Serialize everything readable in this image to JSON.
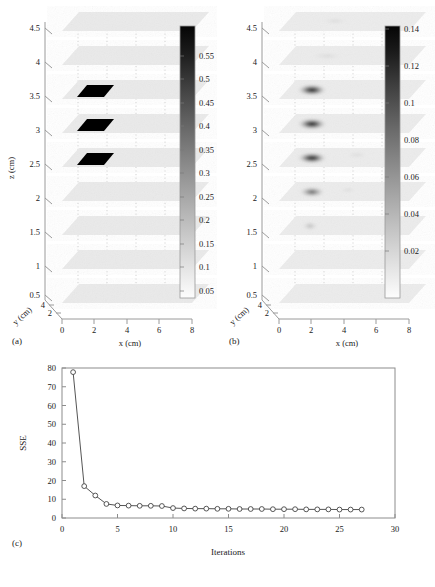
{
  "figure": {
    "background": "#ffffff",
    "axis_color": "#9a9a9a",
    "text_color": "#1a1a1a",
    "line_color": "#4d4d4d",
    "anomaly_color": "#000000"
  },
  "panels": [
    {
      "tag": "(a)",
      "type": "3d-slice-stack",
      "x_axis": {
        "label": "x (cm)",
        "ticks": [
          "0",
          "2",
          "4",
          "6",
          "8"
        ],
        "min": 0,
        "max": 8
      },
      "y_axis": {
        "label": "y (cm)",
        "ticks": [
          "2",
          "4"
        ],
        "min": 0,
        "max": 5
      },
      "z_axis": {
        "label": "z (cm)",
        "ticks": [
          "0.5",
          "1",
          "1.5",
          "2",
          "2.5",
          "3",
          "3.5",
          "4",
          "4.5"
        ],
        "min": 0.5,
        "max": 4.5
      },
      "colorbar": {
        "ticks": [
          "0.05",
          "0.1",
          "0.15",
          "0.2",
          "0.25",
          "0.3",
          "0.35",
          "0.4",
          "0.45",
          "0.5",
          "0.55"
        ],
        "min": 0.0,
        "max": 0.58,
        "colormap": "gray-inverted"
      },
      "slices": [
        {
          "z": 4.5,
          "anomaly": false,
          "peak": 0.0
        },
        {
          "z": 4.0,
          "anomaly": false,
          "peak": 0.0
        },
        {
          "z": 3.5,
          "anomaly": true,
          "peak": 0.58
        },
        {
          "z": 3.0,
          "anomaly": true,
          "peak": 0.58
        },
        {
          "z": 2.5,
          "anomaly": true,
          "peak": 0.58
        },
        {
          "z": 2.0,
          "anomaly": false,
          "peak": 0.0
        },
        {
          "z": 1.5,
          "anomaly": false,
          "peak": 0.0
        },
        {
          "z": 1.0,
          "anomaly": false,
          "peak": 0.0
        },
        {
          "z": 0.5,
          "anomaly": false,
          "peak": 0.0
        }
      ],
      "anomaly_extent": {
        "x_min": 1.6,
        "x_max": 3.2,
        "y_min": 2.0,
        "y_max": 3.4
      }
    },
    {
      "tag": "(b)",
      "type": "3d-slice-stack",
      "x_axis": {
        "label": "x (cm)",
        "ticks": [
          "0",
          "2",
          "4",
          "6",
          "8"
        ],
        "min": 0,
        "max": 8
      },
      "y_axis": {
        "label": "y (cm)",
        "ticks": [
          "2",
          "4"
        ],
        "min": 0,
        "max": 5
      },
      "z_axis": {
        "label": "z (cm)",
        "ticks": [
          "0.5",
          "1",
          "1.5",
          "2",
          "2.5",
          "3",
          "3.5",
          "4",
          "4.5"
        ],
        "min": 0.5,
        "max": 4.5
      },
      "colorbar": {
        "ticks": [
          "0.02",
          "0.04",
          "0.06",
          "0.08",
          "0.1",
          "0.12",
          "0.14"
        ],
        "min": 0.0,
        "max": 0.148,
        "colormap": "gray-inverted"
      },
      "slices": [
        {
          "z": 4.5,
          "anomaly": true,
          "peak": 0.018
        },
        {
          "z": 4.0,
          "anomaly": true,
          "peak": 0.03
        },
        {
          "z": 3.5,
          "anomaly": true,
          "peak": 0.14
        },
        {
          "z": 3.0,
          "anomaly": true,
          "peak": 0.138
        },
        {
          "z": 2.5,
          "anomaly": true,
          "peak": 0.13
        },
        {
          "z": 2.0,
          "anomaly": true,
          "peak": 0.095
        },
        {
          "z": 1.5,
          "anomaly": true,
          "peak": 0.055
        },
        {
          "z": 1.0,
          "anomaly": false,
          "peak": 0.0
        },
        {
          "z": 0.5,
          "anomaly": false,
          "peak": 0.0
        }
      ],
      "anomaly_extent": {
        "x_min": 1.4,
        "x_max": 3.4,
        "y_min": 1.8,
        "y_max": 3.6
      }
    }
  ],
  "chart_data": {
    "type": "line",
    "tag": "(c)",
    "title": "",
    "xlabel": "Iterations",
    "ylabel": "SSE",
    "xlim": [
      0,
      30
    ],
    "ylim": [
      0,
      80
    ],
    "xticks": [
      0,
      5,
      10,
      15,
      20,
      25,
      30
    ],
    "yticks": [
      0,
      10,
      20,
      30,
      40,
      50,
      60,
      70,
      80
    ],
    "grid": false,
    "legend": null,
    "marker": "circle-open",
    "x": [
      1,
      2,
      3,
      4,
      5,
      6,
      7,
      8,
      9,
      10,
      11,
      12,
      13,
      14,
      15,
      16,
      17,
      18,
      19,
      20,
      21,
      22,
      23,
      24,
      25,
      26,
      27
    ],
    "values": [
      77.8,
      17.0,
      12.0,
      7.5,
      6.7,
      6.6,
      6.5,
      6.5,
      6.4,
      5.3,
      5.1,
      5.0,
      5.0,
      4.9,
      4.9,
      4.8,
      4.8,
      4.8,
      4.7,
      4.7,
      4.7,
      4.6,
      4.6,
      4.6,
      4.5,
      4.5,
      4.5
    ]
  }
}
